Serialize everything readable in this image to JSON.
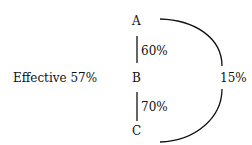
{
  "diagram": {
    "nodes": [
      {
        "id": "A",
        "label": "A"
      },
      {
        "id": "B",
        "label": "B"
      },
      {
        "id": "C",
        "label": "C"
      }
    ],
    "edges": [
      {
        "from": "A",
        "to": "B",
        "label": "60%"
      },
      {
        "from": "B",
        "to": "C",
        "label": "70%"
      },
      {
        "from": "A",
        "to": "C",
        "label": "15%",
        "shape": "arc"
      }
    ],
    "annotation": "Effective 57%"
  }
}
